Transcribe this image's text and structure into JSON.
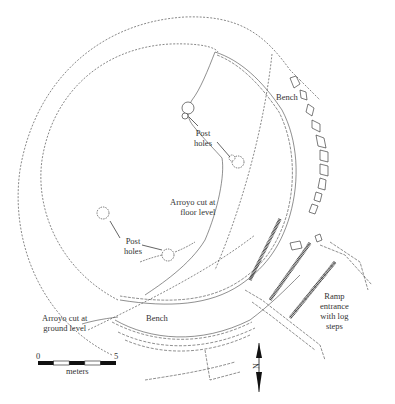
{
  "figure": {
    "type": "archaeological site plan",
    "labels": {
      "bench_upper": "Bench",
      "bench_lower": "Bench",
      "post_holes_upper_line1": "Post",
      "post_holes_upper_line2": "holes",
      "post_holes_lower_line1": "Post",
      "post_holes_lower_line2": "holes",
      "arroyo_floor_line1": "Arroyo cut at",
      "arroyo_floor_line2": "floor level",
      "arroyo_ground_line1": "Arroyo cut at",
      "arroyo_ground_line2": "ground level",
      "ramp_line1": "Ramp",
      "ramp_line2": "entrance",
      "ramp_line3": "with log",
      "ramp_line4": "steps"
    },
    "scale_bar": {
      "start": "0",
      "end": "5",
      "unit": "meters",
      "segments": 5
    },
    "north_arrow": {
      "label": "N"
    },
    "colors": {
      "background": "#ffffff",
      "ink": "#222222"
    }
  }
}
